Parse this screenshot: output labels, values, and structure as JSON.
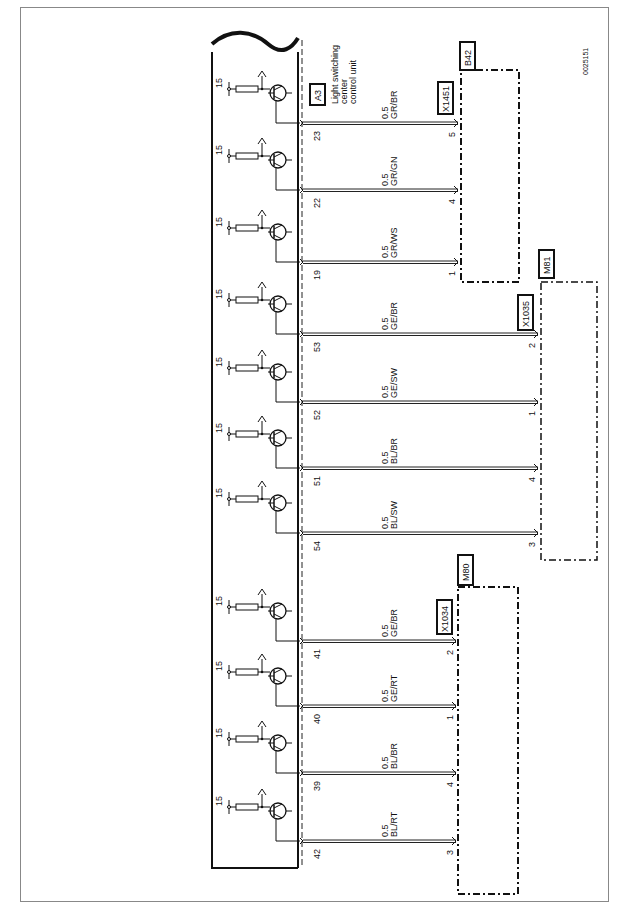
{
  "figure_id": "0025151",
  "control_unit": {
    "id": "A3",
    "label_lines": [
      "Light switching",
      "center",
      "control unit"
    ]
  },
  "supply_label": "15",
  "ground_label": "4",
  "wire_gauge": "0.5",
  "wires": [
    {
      "pin": "23",
      "color": "GR/BR",
      "component": "B42",
      "connector_pin": "5",
      "y": 123
    },
    {
      "pin": "22",
      "color": "GR/GN",
      "component": "B42",
      "connector_pin": "4",
      "y": 190
    },
    {
      "pin": "19",
      "color": "GR/WS",
      "component": "B42",
      "connector_pin": "1",
      "y": 262
    },
    {
      "pin": "53",
      "color": "GE/BR",
      "component": "M81",
      "connector_pin": "2",
      "y": 334
    },
    {
      "pin": "52",
      "color": "GE/SW",
      "component": "M81",
      "connector_pin": "1",
      "y": 402
    },
    {
      "pin": "51",
      "color": "BL/BR",
      "component": "M81",
      "connector_pin": "4",
      "y": 468
    },
    {
      "pin": "54",
      "color": "BL/SW",
      "component": "M81",
      "connector_pin": "3",
      "y": 533
    },
    {
      "pin": "41",
      "color": "GE/BR",
      "component": "M80",
      "connector_pin": "2",
      "y": 641
    },
    {
      "pin": "40",
      "color": "GE/RT",
      "component": "M80",
      "connector_pin": "1",
      "y": 706
    },
    {
      "pin": "39",
      "color": "BL/BR",
      "component": "M80",
      "connector_pin": "4",
      "y": 773
    },
    {
      "pin": "42",
      "color": "BL/RT",
      "component": "M80",
      "connector_pin": "3",
      "y": 841
    }
  ],
  "components": [
    {
      "id": "B42",
      "connector": "X1451"
    },
    {
      "id": "M81",
      "connector": "X1035"
    },
    {
      "id": "M80",
      "connector": "X1034"
    }
  ]
}
